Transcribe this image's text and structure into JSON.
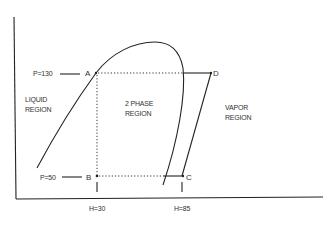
{
  "diagram": {
    "type": "pressure-enthalpy",
    "points": {
      "A": {
        "label": "A",
        "P": 130,
        "H": 30
      },
      "B": {
        "label": "B",
        "P": 50,
        "H": 30
      },
      "C": {
        "label": "C",
        "P": 50,
        "H": 85
      },
      "D": {
        "label": "D",
        "P": 130,
        "H": "superheated"
      }
    },
    "pressure_labels": {
      "high": "P=130",
      "low": "P=50"
    },
    "enthalpy_labels": {
      "left": "H=30",
      "right": "H=85"
    },
    "regions": {
      "liquid": [
        "LIQUID",
        "REGION"
      ],
      "two_phase": [
        "2 PHASE",
        "REGION"
      ],
      "vapor": [
        "VAPOR",
        "REGION"
      ]
    },
    "colors": {
      "line": "#222222",
      "text": "#333333",
      "background": "#ffffff"
    }
  }
}
